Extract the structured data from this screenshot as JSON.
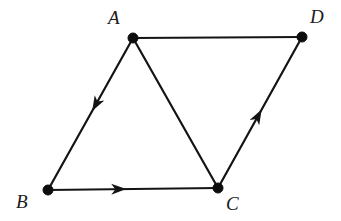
{
  "figure": {
    "type": "directed-graph",
    "width": 341,
    "height": 221,
    "background_color": "#ffffff",
    "stroke_color": "#141414",
    "node_color": "#0d0d0d",
    "node_radius": 5
  },
  "nodes": [
    {
      "id": "A",
      "label": "A",
      "x": 133,
      "y": 38,
      "label_x": 108,
      "label_y": 8,
      "label_position": "upper-left"
    },
    {
      "id": "B",
      "label": "B",
      "x": 48,
      "y": 190,
      "label_x": 16,
      "label_y": 192,
      "label_position": "lower-left"
    },
    {
      "id": "C",
      "label": "C",
      "x": 218,
      "y": 188,
      "label_x": 226,
      "label_y": 194,
      "label_position": "lower-right"
    },
    {
      "id": "D",
      "label": "D",
      "x": 302,
      "y": 37,
      "label_x": 310,
      "label_y": 7,
      "label_position": "upper-right"
    }
  ],
  "edges": [
    {
      "id": "edge-a-d",
      "from": "A",
      "to": "D",
      "directed": false,
      "arrow_at": null
    },
    {
      "id": "edge-a-b",
      "from": "A",
      "to": "B",
      "directed": true,
      "arrow_at": 0.48
    },
    {
      "id": "edge-a-c",
      "from": "A",
      "to": "C",
      "directed": false,
      "arrow_at": null
    },
    {
      "id": "edge-b-c",
      "from": "B",
      "to": "C",
      "directed": true,
      "arrow_at": 0.46
    },
    {
      "id": "edge-c-d",
      "from": "C",
      "to": "D",
      "directed": true,
      "arrow_at": 0.52
    }
  ],
  "arrow": {
    "length": 15,
    "half_width": 5.5
  }
}
